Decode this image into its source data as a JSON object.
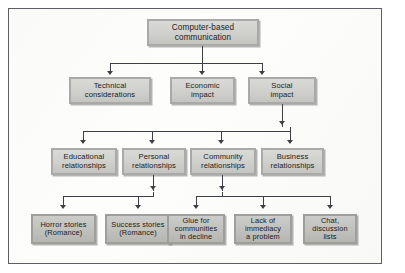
{
  "diagram": {
    "type": "tree",
    "orientation": "top-down",
    "colors": {
      "box_fill": "#d0d0cc",
      "box_border": "#a9a9a7",
      "connector": "#3c4044",
      "frame_border": "#5b5f63",
      "page_background": "#fdfdfc",
      "text": "#1c1c1c"
    },
    "levels": [
      {
        "level": 1,
        "nodes": [
          {
            "id": "root",
            "label": "Computer-based\ncommunication"
          }
        ]
      },
      {
        "level": 2,
        "nodes": [
          {
            "id": "technical",
            "label": "Technical\nconsiderations"
          },
          {
            "id": "economic",
            "label": "Economic\nimpact"
          },
          {
            "id": "social",
            "label": "Social\nimpact"
          }
        ]
      },
      {
        "level": 3,
        "nodes": [
          {
            "id": "educational",
            "label": "Educational\nrelationships"
          },
          {
            "id": "personal",
            "label": "Personal\nrelationships"
          },
          {
            "id": "community",
            "label": "Community\nrelationships"
          },
          {
            "id": "business",
            "label": "Business\nrelationships"
          }
        ]
      },
      {
        "level": 4,
        "nodes": [
          {
            "id": "horror",
            "label": "Horror stories\n(Romance)"
          },
          {
            "id": "success",
            "label": "Success stories\n(Romance)"
          },
          {
            "id": "glue",
            "label": "Glue for\ncommunities\nin decline"
          },
          {
            "id": "immediacy",
            "label": "Lack of\nimmediacy\na problem"
          },
          {
            "id": "chat",
            "label": "Chat,\ndiscussion\nlists"
          }
        ]
      }
    ],
    "edges": [
      {
        "from": "root",
        "to": "technical"
      },
      {
        "from": "root",
        "to": "economic"
      },
      {
        "from": "root",
        "to": "social"
      },
      {
        "from": "social",
        "to": "educational"
      },
      {
        "from": "social",
        "to": "personal"
      },
      {
        "from": "social",
        "to": "community"
      },
      {
        "from": "social",
        "to": "business"
      },
      {
        "from": "personal",
        "to": "horror"
      },
      {
        "from": "personal",
        "to": "success"
      },
      {
        "from": "community",
        "to": "glue"
      },
      {
        "from": "community",
        "to": "immediacy"
      },
      {
        "from": "community",
        "to": "chat"
      }
    ]
  }
}
